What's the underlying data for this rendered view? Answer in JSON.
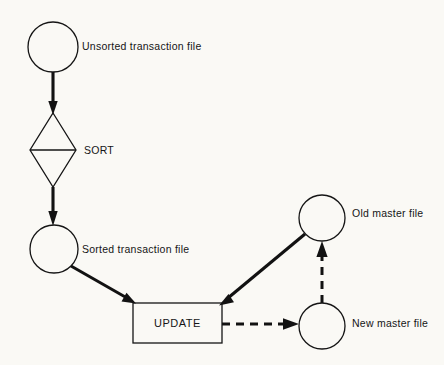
{
  "diagram": {
    "background_color": "#faf9f5",
    "line_color": "#121212",
    "nodes": [
      {
        "id": "unsorted-transaction-file",
        "type": "circle",
        "label": "Unsorted  transaction file",
        "label_position": "right",
        "cx": 53,
        "cy": 47,
        "r": 25
      },
      {
        "id": "sort",
        "type": "diamond",
        "label": "SORT",
        "label_position": "right",
        "cx": 53,
        "cy": 150,
        "rx": 23,
        "ry": 37
      },
      {
        "id": "sorted-transaction-file",
        "type": "circle",
        "label": "Sorted transaction file",
        "label_position": "right",
        "cx": 54,
        "cy": 249,
        "r": 24
      },
      {
        "id": "update",
        "type": "rectangle",
        "label": "UPDATE",
        "label_position": "inside",
        "x": 133,
        "y": 303,
        "width": 89,
        "height": 40
      },
      {
        "id": "old-master-file",
        "type": "circle",
        "label": "Old master file",
        "label_position": "right",
        "cx": 322,
        "cy": 218,
        "r": 23
      },
      {
        "id": "new-master-file",
        "type": "circle",
        "label": "New master file",
        "label_position": "right",
        "cx": 322,
        "cy": 326,
        "r": 23
      }
    ],
    "edges": [
      {
        "id": "edge-unsorted-to-sort",
        "from": "unsorted-transaction-file",
        "to": "sort",
        "style": "solid",
        "direction": "down"
      },
      {
        "id": "edge-sort-to-sorted",
        "from": "sort",
        "to": "sorted-transaction-file",
        "style": "solid",
        "direction": "down"
      },
      {
        "id": "edge-sorted-to-update",
        "from": "sorted-transaction-file",
        "to": "update",
        "style": "solid",
        "direction": "diagonal-down-right"
      },
      {
        "id": "edge-old-master-to-update",
        "from": "old-master-file",
        "to": "update",
        "style": "solid",
        "direction": "diagonal-down-left"
      },
      {
        "id": "edge-update-to-new-master",
        "from": "update",
        "to": "new-master-file",
        "style": "dashed",
        "direction": "right"
      },
      {
        "id": "edge-new-master-to-old-master",
        "from": "new-master-file",
        "to": "old-master-file",
        "style": "dashed",
        "direction": "up"
      }
    ],
    "labels": {
      "unsorted_transaction_file": "Unsorted  transaction file",
      "sort": "SORT",
      "sorted_transaction_file": "Sorted transaction file",
      "update": "UPDATE",
      "old_master_file": "Old master file",
      "new_master_file": "New master file"
    }
  }
}
